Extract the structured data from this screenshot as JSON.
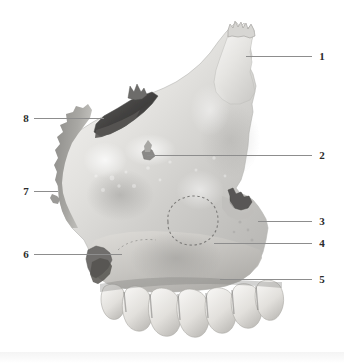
{
  "figure": {
    "background_color": "#ffffff",
    "leader_line_color": "#8d8d8d",
    "label_color": "#2b2b2b"
  },
  "labels": [
    {
      "id": "label-1",
      "text": "1",
      "x": 316,
      "y": 51,
      "line": {
        "x": 246,
        "y": 56,
        "width": 66
      }
    },
    {
      "id": "label-2",
      "text": "2",
      "x": 316,
      "y": 150,
      "line": {
        "x": 147,
        "y": 155,
        "width": 165
      }
    },
    {
      "id": "label-3",
      "text": "3",
      "x": 316,
      "y": 216,
      "line": {
        "x": 258,
        "y": 221,
        "width": 54
      }
    },
    {
      "id": "label-4",
      "text": "4",
      "x": 316,
      "y": 238,
      "line": {
        "x": 214,
        "y": 243,
        "width": 98
      }
    },
    {
      "id": "label-5",
      "text": "5",
      "x": 316,
      "y": 274,
      "line": {
        "x": 220,
        "y": 279,
        "width": 92
      }
    },
    {
      "id": "label-6",
      "text": "6",
      "x": 24,
      "y": 249,
      "line": {
        "x": 34,
        "y": 254,
        "width": 88
      }
    },
    {
      "id": "label-7",
      "text": "7",
      "x": 24,
      "y": 186,
      "line": {
        "x": 34,
        "y": 191,
        "width": 24
      }
    },
    {
      "id": "label-8",
      "text": "8",
      "x": 24,
      "y": 113,
      "line": {
        "x": 34,
        "y": 118,
        "width": 70
      }
    }
  ],
  "bone_regions": [
    {
      "name": "frontal-process",
      "label_ref": "1"
    },
    {
      "name": "infraorbital-foramen",
      "label_ref": "2"
    },
    {
      "name": "zygomatic-process",
      "label_ref": "3"
    },
    {
      "name": "maxillary-tuberosity",
      "label_ref": "4"
    },
    {
      "name": "alveolar-process",
      "label_ref": "5"
    },
    {
      "name": "anterior-nasal-spine",
      "label_ref": "6"
    },
    {
      "name": "nasal-notch",
      "label_ref": "7"
    },
    {
      "name": "lacrimal-groove",
      "label_ref": "8"
    }
  ],
  "features": {
    "sinus_outline_name": "maxillary-sinus-dashed-outline",
    "teeth_count": 7
  }
}
